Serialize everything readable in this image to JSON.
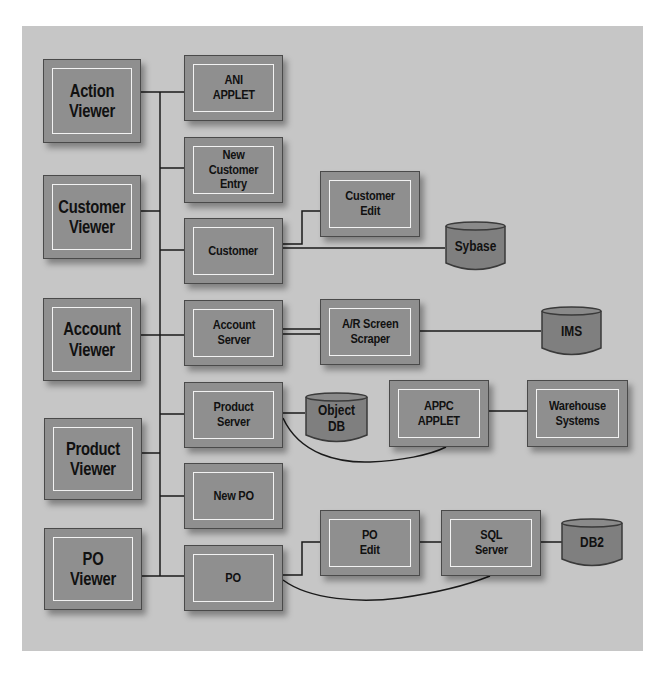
{
  "diagram": {
    "type": "system-architecture",
    "viewers": [
      {
        "id": "action-viewer",
        "label": "Action\nViewer"
      },
      {
        "id": "customer-viewer",
        "label": "Customer\nViewer"
      },
      {
        "id": "account-viewer",
        "label": "Account\nViewer"
      },
      {
        "id": "product-viewer",
        "label": "Product\nViewer"
      },
      {
        "id": "po-viewer",
        "label": "PO\nViewer"
      }
    ],
    "components": [
      {
        "id": "ani-applet",
        "label": "ANI\nAPPLET"
      },
      {
        "id": "new-customer-entry",
        "label": "New Customer\nEntry"
      },
      {
        "id": "customer",
        "label": "Customer"
      },
      {
        "id": "account-server",
        "label": "Account\nServer"
      },
      {
        "id": "product-server",
        "label": "Product\nServer"
      },
      {
        "id": "new-po",
        "label": "New PO"
      },
      {
        "id": "po",
        "label": "PO"
      }
    ],
    "services": [
      {
        "id": "customer-edit",
        "label": "Customer\nEdit"
      },
      {
        "id": "ar-screen-scraper",
        "label": "A/R Screen\nScraper"
      },
      {
        "id": "appc-applet",
        "label": "APPC\nAPPLET"
      },
      {
        "id": "warehouse-systems",
        "label": "Warehouse\nSystems"
      },
      {
        "id": "po-edit",
        "label": "PO\nEdit"
      },
      {
        "id": "sql-server",
        "label": "SQL\nServer"
      }
    ],
    "databases": [
      {
        "id": "sybase",
        "label": "Sybase"
      },
      {
        "id": "ims",
        "label": "IMS"
      },
      {
        "id": "object-db",
        "label": "Object\nDB"
      },
      {
        "id": "db2",
        "label": "DB2"
      }
    ],
    "edges": [
      [
        "action-viewer",
        "bus"
      ],
      [
        "customer-viewer",
        "bus"
      ],
      [
        "account-viewer",
        "bus"
      ],
      [
        "product-viewer",
        "bus"
      ],
      [
        "po-viewer",
        "bus"
      ],
      [
        "bus",
        "ani-applet"
      ],
      [
        "bus",
        "new-customer-entry"
      ],
      [
        "bus",
        "customer"
      ],
      [
        "bus",
        "account-server"
      ],
      [
        "bus",
        "product-server"
      ],
      [
        "bus",
        "new-po"
      ],
      [
        "bus",
        "po"
      ],
      [
        "customer",
        "customer-edit"
      ],
      [
        "customer",
        "sybase"
      ],
      [
        "account-server",
        "ar-screen-scraper"
      ],
      [
        "ar-screen-scraper",
        "ims"
      ],
      [
        "product-server",
        "object-db"
      ],
      [
        "product-server",
        "appc-applet"
      ],
      [
        "appc-applet",
        "warehouse-systems"
      ],
      [
        "po",
        "po-edit"
      ],
      [
        "po-edit",
        "sql-server"
      ],
      [
        "sql-server",
        "db2"
      ],
      [
        "po",
        "sql-server"
      ]
    ]
  },
  "colors": {
    "panel": "#c6c6c6",
    "box_fill": "#8f8f8f",
    "box_border": "#4a4a4a",
    "inner_border": "#f2f2f2",
    "line": "#1a1a1a",
    "db_fill": "#7f7f7f"
  }
}
